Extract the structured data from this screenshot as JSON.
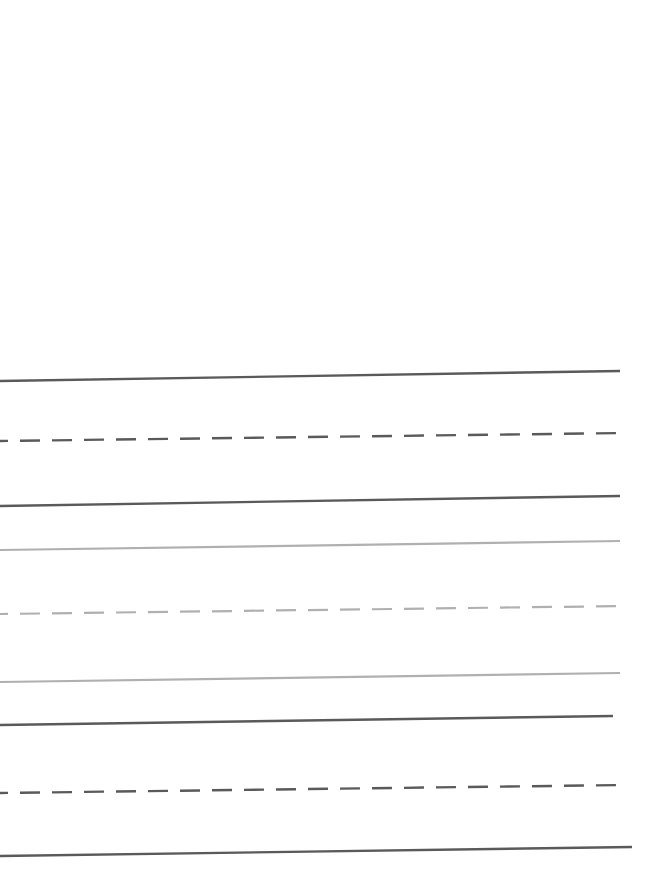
{
  "figure": {
    "background_color": "#ffffff",
    "width": 661,
    "height": 884,
    "blank_top_region_height": 360,
    "colors": {
      "dark_gray": "#5a5a5a",
      "light_gray": "#b0b0b0"
    },
    "dash_pattern": "20 12"
  },
  "chart_data": {
    "type": "line",
    "title": "",
    "subtitle": "",
    "xlabel": "",
    "ylabel": "",
    "xlim": [
      0,
      661
    ],
    "ylim": [
      884,
      0
    ],
    "grid": false,
    "legend": "none",
    "axis_visible": false,
    "tick_labels_x": [],
    "tick_labels_y": [],
    "annotations": [],
    "note": "Nine nearly-horizontal line segments, each rising slightly from left to right. Y values are pixel rows measured from the top of the 884px canvas.",
    "series": [
      {
        "name": "line-1",
        "index": 1,
        "style": "solid",
        "color": "#5a5a5a",
        "stroke_width": 2.4,
        "group": "upper",
        "x": [
          0,
          620
        ],
        "y": [
          381,
          371
        ]
      },
      {
        "name": "line-2",
        "index": 2,
        "style": "dashed",
        "color": "#5a5a5a",
        "stroke_width": 2.4,
        "group": "upper",
        "x": [
          0,
          625
        ],
        "y": [
          441,
          433
        ]
      },
      {
        "name": "line-3",
        "index": 3,
        "style": "solid",
        "color": "#5a5a5a",
        "stroke_width": 2.4,
        "group": "upper",
        "x": [
          0,
          620
        ],
        "y": [
          506,
          496
        ]
      },
      {
        "name": "line-4",
        "index": 4,
        "style": "solid",
        "color": "#b0b0b0",
        "stroke_width": 2.2,
        "group": "middle",
        "x": [
          0,
          620
        ],
        "y": [
          550,
          541
        ]
      },
      {
        "name": "line-5",
        "index": 5,
        "style": "dashed",
        "color": "#b0b0b0",
        "stroke_width": 2.2,
        "group": "middle",
        "x": [
          0,
          625
        ],
        "y": [
          614,
          606
        ]
      },
      {
        "name": "line-6",
        "index": 6,
        "style": "solid",
        "color": "#b0b0b0",
        "stroke_width": 2.2,
        "group": "middle",
        "x": [
          0,
          620
        ],
        "y": [
          682,
          673
        ]
      },
      {
        "name": "line-7",
        "index": 7,
        "style": "solid",
        "color": "#5a5a5a",
        "stroke_width": 2.4,
        "group": "lower",
        "x": [
          0,
          613
        ],
        "y": [
          725,
          716
        ]
      },
      {
        "name": "line-8",
        "index": 8,
        "style": "dashed",
        "color": "#5a5a5a",
        "stroke_width": 2.4,
        "group": "lower",
        "x": [
          0,
          625
        ],
        "y": [
          793,
          785
        ]
      },
      {
        "name": "line-9",
        "index": 9,
        "style": "solid",
        "color": "#5a5a5a",
        "stroke_width": 2.4,
        "group": "lower",
        "x": [
          0,
          632
        ],
        "y": [
          856,
          847
        ]
      }
    ]
  }
}
